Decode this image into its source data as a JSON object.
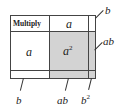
{
  "diagram": {
    "title": "Multiply",
    "column_headers": [
      "a",
      "b"
    ],
    "row_headers": [
      "a",
      "b"
    ],
    "cells": {
      "a_a": {
        "base": "a",
        "exp": "2"
      },
      "a_b": "ab",
      "b_a": "ab",
      "b_b": {
        "base": "b",
        "exp": "2"
      }
    },
    "side_labels": {
      "right_top": "b",
      "right_mid": "ab",
      "bottom_left": "b",
      "bottom_mid": "ab",
      "bottom_right": {
        "base": "b",
        "exp": "2"
      }
    },
    "colors": {
      "gray_fill": "#d3d3d3",
      "border": "#444444"
    }
  }
}
